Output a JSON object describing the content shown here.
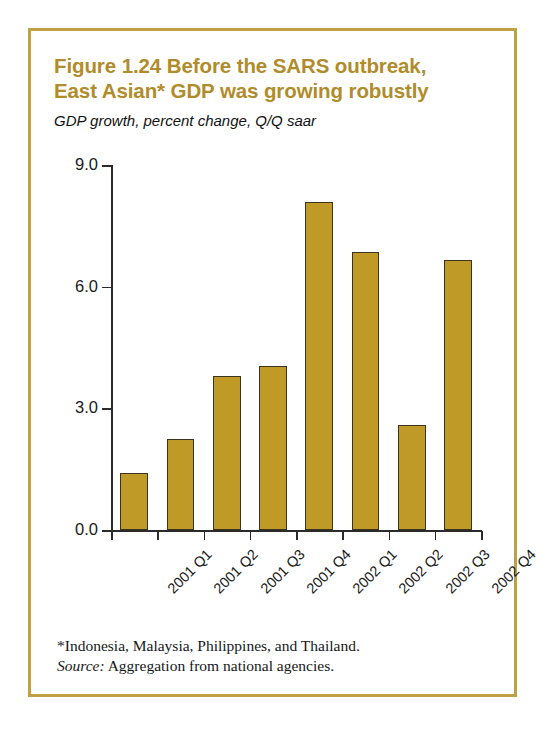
{
  "figure": {
    "title": "Figure 1.24  Before the SARS outbreak,\nEast Asian* GDP was growing robustly",
    "subtitle": "GDP growth, percent change, Q/Q saar",
    "border_color": "#bfa043",
    "title_color": "#b08c2a",
    "bar_color": "#c09a27",
    "bar_outline_color": "#3a3320"
  },
  "footnotes": {
    "note": "*Indonesia, Malaysia, Philippines, and Thailand.",
    "source_label": "Source:",
    "source_text": " Aggregation from national agencies."
  },
  "chart_data": {
    "type": "bar",
    "title": "Figure 1.24  Before the SARS outbreak, East Asian* GDP was growing robustly",
    "subtitle": "GDP growth, percent change, Q/Q saar",
    "xlabel": "",
    "ylabel": "GDP growth, percent change, Q/Q saar",
    "categories": [
      "2001 Q1",
      "2001 Q2",
      "2001 Q3",
      "2001 Q4",
      "2002 Q1",
      "2002 Q2",
      "2002 Q3",
      "2002 Q4"
    ],
    "values": [
      1.4,
      2.25,
      3.8,
      4.05,
      8.1,
      6.85,
      2.6,
      6.65
    ],
    "ylim": [
      0.0,
      9.0
    ],
    "yticks": [
      "0.0",
      "3.0",
      "6.0",
      "9.0"
    ],
    "ytick_values": [
      0.0,
      3.0,
      6.0,
      9.0
    ],
    "grid": false,
    "legend": null,
    "series": [
      {
        "name": "GDP growth",
        "values": [
          1.4,
          2.25,
          3.8,
          4.05,
          8.1,
          6.85,
          2.6,
          6.65
        ]
      }
    ]
  }
}
